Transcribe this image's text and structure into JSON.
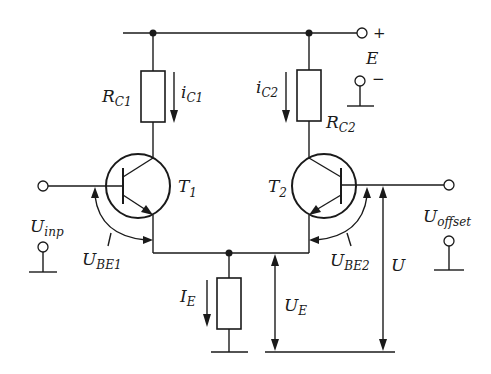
{
  "diagram": {
    "type": "differential amplifier circuit (BJT pair)",
    "supply": {
      "label": "E",
      "plus": "+",
      "minus": "−"
    },
    "resistors": [
      {
        "id": "RC1",
        "main": "R",
        "sub": "C1"
      },
      {
        "id": "RC2",
        "main": "R",
        "sub": "C2"
      },
      {
        "id": "RE",
        "main": "",
        "sub": ""
      }
    ],
    "currents": [
      {
        "id": "iC1",
        "main": "i",
        "sub": "C1"
      },
      {
        "id": "iC2",
        "main": "i",
        "sub": "C2"
      },
      {
        "id": "IE",
        "main": "I",
        "sub": "E"
      }
    ],
    "transistors": [
      {
        "id": "T1",
        "main": "T",
        "sub": "1"
      },
      {
        "id": "T2",
        "main": "T",
        "sub": "2"
      }
    ],
    "voltages": [
      {
        "id": "Uinp",
        "main": "U",
        "sub": "inp"
      },
      {
        "id": "Uoffset",
        "main": "U",
        "sub": "offset"
      },
      {
        "id": "UBE1",
        "main": "U",
        "sub": "BE1"
      },
      {
        "id": "UBE2",
        "main": "U",
        "sub": "BE2"
      },
      {
        "id": "UE",
        "main": "U",
        "sub": "E"
      },
      {
        "id": "U",
        "main": "U",
        "sub": ""
      }
    ]
  }
}
